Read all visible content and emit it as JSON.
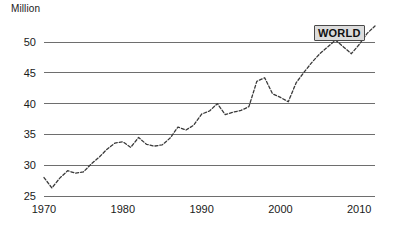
{
  "chart_data": {
    "type": "line",
    "title": "",
    "subtitle": "",
    "xlabel": "",
    "ylabel": "Million",
    "ylabel_position": "top-left",
    "grid": true,
    "grid_axis": "y",
    "legend_position": "inside-top-right",
    "xlim": [
      1970,
      2012
    ],
    "ylim": [
      25,
      52.5
    ],
    "yticks": [
      25,
      30,
      35,
      40,
      45,
      50
    ],
    "ytick_labels": [
      "25",
      "30",
      "35",
      "40",
      "45",
      "50"
    ],
    "xticks": [
      1970,
      1980,
      1990,
      2000,
      2010
    ],
    "xtick_labels": [
      "1970",
      "1980",
      "1990",
      "2000",
      "2010"
    ],
    "line_style": "dashed",
    "line_color": "#3a3a3a",
    "grid_color": "#6e6e6e",
    "annotations": [
      {
        "text": "WORLD",
        "kind": "series-label",
        "x": 2007.5,
        "y": 51.5,
        "box_fill": "#dcdcdc",
        "box_border": "#4a4a4a"
      }
    ],
    "series": [
      {
        "name": "WORLD",
        "x": [
          1970,
          1971,
          1972,
          1973,
          1974,
          1975,
          1976,
          1977,
          1978,
          1979,
          1980,
          1981,
          1982,
          1983,
          1984,
          1985,
          1986,
          1987,
          1988,
          1989,
          1990,
          1991,
          1992,
          1993,
          1994,
          1995,
          1996,
          1997,
          1998,
          1999,
          2000,
          2001,
          2002,
          2003,
          2004,
          2005,
          2006,
          2007,
          2008,
          2009,
          2010,
          2011,
          2012
        ],
        "values": [
          28.0,
          26.3,
          27.9,
          29.1,
          28.7,
          28.9,
          30.2,
          31.3,
          32.6,
          33.6,
          33.8,
          32.9,
          34.5,
          33.4,
          33.1,
          33.3,
          34.4,
          36.2,
          35.7,
          36.5,
          38.3,
          38.8,
          40.0,
          38.2,
          38.6,
          38.9,
          39.5,
          43.6,
          44.2,
          41.6,
          41.0,
          40.3,
          43.4,
          45.1,
          46.7,
          48.1,
          49.2,
          50.3,
          49.2,
          48.1,
          49.6,
          51.4,
          52.6
        ]
      }
    ]
  },
  "axis": {
    "ylabel": "Million"
  },
  "series_label": {
    "text": "WORLD"
  }
}
